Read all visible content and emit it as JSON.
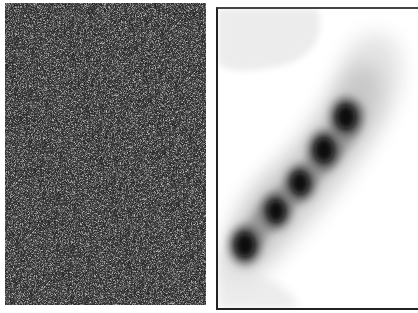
{
  "panels": [
    {
      "id": "noisy-image",
      "description": "grayscale noise field",
      "background": "#3a3a3a"
    },
    {
      "id": "density-map",
      "description": "smoothed density with diagonal chain of blobs"
    }
  ],
  "blobs": [
    {
      "cx": 27,
      "cy": 236,
      "r": 12
    },
    {
      "cx": 58,
      "cy": 202,
      "r": 11
    },
    {
      "cx": 82,
      "cy": 174,
      "r": 11
    },
    {
      "cx": 106,
      "cy": 141,
      "r": 12
    },
    {
      "cx": 128,
      "cy": 108,
      "r": 12
    }
  ]
}
